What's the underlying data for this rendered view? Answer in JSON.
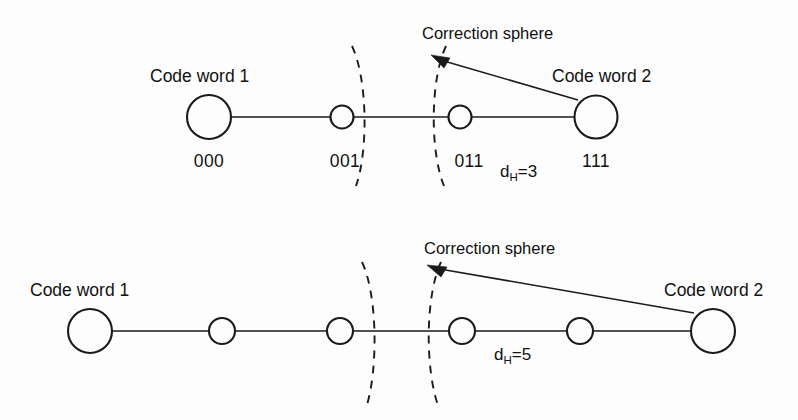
{
  "figure": {
    "background": "#fdfdfd",
    "ink_color": "#1a1a1a",
    "width": 798,
    "height": 420
  },
  "panels": [
    {
      "id": "top-panel",
      "name": "hamming-distance-3-panel",
      "baseline_y": 117,
      "distance_label": {
        "text": "d",
        "subscript": "H",
        "value": "=3",
        "full": "dH=3",
        "x": 500,
        "y": 177
      },
      "left_codeword_label": {
        "text": "Code word 1",
        "x": 150,
        "y": 82
      },
      "right_codeword_label": {
        "text": "Code word 2",
        "x": 552,
        "y": 82
      },
      "sphere_label": {
        "text": "Correction sphere",
        "x": 422,
        "y": 39
      },
      "nodes": [
        {
          "name": "codeword-1-node",
          "cx": 209,
          "cy": 117,
          "r": 22,
          "size": "large",
          "bits": "000",
          "bits_x": 209,
          "bits_y": 167
        },
        {
          "name": "neighbour-node-001",
          "cx": 342,
          "cy": 117,
          "r": 11.5,
          "size": "small",
          "bits": "001",
          "bits_x": 345,
          "bits_y": 167
        },
        {
          "name": "neighbour-node-011",
          "cx": 460,
          "cy": 117,
          "r": 11.5,
          "size": "small",
          "bits": "011",
          "bits_x": 469,
          "bits_y": 167
        },
        {
          "name": "codeword-2-node",
          "cx": 596,
          "cy": 117,
          "r": 21.5,
          "size": "large",
          "bits": "111",
          "bits_x": 596,
          "bits_y": 167
        }
      ],
      "arcs": [
        {
          "name": "correction-sphere-arc-left",
          "cross_x": 358,
          "top_y": 46,
          "bottom_y": 186,
          "bulge": "right"
        },
        {
          "name": "correction-sphere-arc-right",
          "cross_x": 437,
          "top_y": 46,
          "bottom_y": 186,
          "bulge": "left"
        }
      ],
      "leader": {
        "from_x": 578,
        "from_y": 100,
        "to_x": 434,
        "to_y": 57
      }
    },
    {
      "id": "bottom-panel",
      "name": "hamming-distance-5-panel",
      "baseline_y": 331,
      "distance_label": {
        "text": "d",
        "subscript": "H",
        "value": "=5",
        "full": "dH=5",
        "x": 494,
        "y": 360
      },
      "left_codeword_label": {
        "text": "Code word 1",
        "x": 30,
        "y": 296
      },
      "right_codeword_label": {
        "text": "Code word 2",
        "x": 664,
        "y": 296
      },
      "sphere_label": {
        "text": "Correction sphere",
        "x": 424,
        "y": 254
      },
      "nodes": [
        {
          "name": "codeword-1-node",
          "cx": 90,
          "cy": 331,
          "r": 22,
          "size": "large",
          "bits": "",
          "bits_x": 90,
          "bits_y": 381
        },
        {
          "name": "neighbour-node-1",
          "cx": 222,
          "cy": 331,
          "r": 13,
          "size": "small",
          "bits": "",
          "bits_x": 222,
          "bits_y": 381
        },
        {
          "name": "neighbour-node-2",
          "cx": 340,
          "cy": 331,
          "r": 13,
          "size": "small",
          "bits": "",
          "bits_x": 340,
          "bits_y": 381
        },
        {
          "name": "neighbour-node-3",
          "cx": 462,
          "cy": 331,
          "r": 13,
          "size": "small",
          "bits": "",
          "bits_x": 462,
          "bits_y": 381
        },
        {
          "name": "neighbour-node-4",
          "cx": 580,
          "cy": 331,
          "r": 13,
          "size": "small",
          "bits": "",
          "bits_x": 580,
          "bits_y": 381
        },
        {
          "name": "codeword-2-node",
          "cx": 713,
          "cy": 331,
          "r": 22,
          "size": "large",
          "bits": "",
          "bits_x": 713,
          "bits_y": 381
        }
      ],
      "arcs": [
        {
          "name": "correction-sphere-arc-left",
          "cross_x": 370,
          "top_y": 262,
          "bottom_y": 408,
          "bulge": "right"
        },
        {
          "name": "correction-sphere-arc-right",
          "cross_x": 432,
          "top_y": 262,
          "bottom_y": 408,
          "bulge": "left"
        }
      ],
      "leader": {
        "from_x": 688,
        "from_y": 312,
        "to_x": 430,
        "to_y": 266
      }
    }
  ]
}
